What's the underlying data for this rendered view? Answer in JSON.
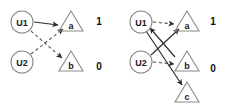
{
  "figure": {
    "width": 227,
    "height": 107,
    "background": "#ffffff",
    "solid_edge_color": "#2b2b2b",
    "dashed_edge_color": "#5f5f5f",
    "node_outline_color": "#8a8a8a",
    "label_color": "#1a1a1a"
  },
  "panels": [
    {
      "id": "left",
      "name": "left-graph",
      "users": [
        {
          "id": "u1",
          "label": "U1",
          "cx": 22,
          "cy": 22,
          "r": 11
        },
        {
          "id": "u2",
          "label": "U2",
          "cx": 22,
          "cy": 62,
          "r": 11
        }
      ],
      "items": [
        {
          "id": "a",
          "label": "a",
          "cx": 71,
          "cy": 23,
          "size": 12,
          "score": "1",
          "score_x": 99,
          "score_y": 20
        },
        {
          "id": "b",
          "label": "b",
          "cx": 71,
          "cy": 63,
          "size": 12,
          "score": "0",
          "score_x": 99,
          "score_y": 66
        }
      ],
      "edges": [
        {
          "from": "u1",
          "to": "a",
          "style": "solid",
          "x1": 34,
          "y1": 22,
          "x2": 58,
          "y2": 25
        },
        {
          "from": "u1",
          "to": "b",
          "style": "dashed",
          "x1": 31,
          "y1": 31,
          "x2": 62,
          "y2": 58
        },
        {
          "from": "u2",
          "to": "a",
          "style": "dashed",
          "x1": 31,
          "y1": 54,
          "x2": 62,
          "y2": 29
        }
      ]
    },
    {
      "id": "right",
      "name": "right-graph",
      "users": [
        {
          "id": "u1",
          "label": "U1",
          "cx": 28,
          "cy": 22,
          "r": 11
        },
        {
          "id": "u2",
          "label": "U2",
          "cx": 28,
          "cy": 62,
          "r": 11
        }
      ],
      "items": [
        {
          "id": "a",
          "label": "a",
          "cx": 74,
          "cy": 23,
          "size": 12,
          "score": "1",
          "score_x": 100,
          "score_y": 20
        },
        {
          "id": "b",
          "label": "b",
          "cx": 74,
          "cy": 63,
          "size": 12,
          "score": "0",
          "score_x": 100,
          "score_y": 68
        },
        {
          "id": "c",
          "label": "c",
          "cx": 74,
          "cy": 94,
          "size": 12,
          "score": "",
          "score_x": 0,
          "score_y": 0
        }
      ],
      "edges": [
        {
          "from": "u1",
          "to": "a",
          "style": "dashed",
          "x1": 40,
          "y1": 22,
          "x2": 61,
          "y2": 24
        },
        {
          "from": "u2",
          "to": "b",
          "style": "dashed",
          "x1": 40,
          "y1": 62,
          "x2": 61,
          "y2": 64
        },
        {
          "from": "u2",
          "to": "a",
          "style": "solid",
          "x1": 38,
          "y1": 55,
          "x2": 65,
          "y2": 29
        },
        {
          "from": "u1",
          "to": "c",
          "style": "solid",
          "x1": 33,
          "y1": 31,
          "x2": 68,
          "y2": 84
        },
        {
          "from": "b",
          "to": "u1",
          "style": "solid",
          "x1": 62,
          "y1": 57,
          "x2": 37,
          "y2": 28
        }
      ]
    }
  ]
}
